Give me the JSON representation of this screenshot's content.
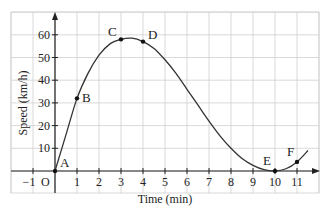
{
  "chart_data": {
    "type": "line",
    "title": "",
    "xlabel": "Time (min)",
    "ylabel": "Speed (km/h)",
    "xlim": [
      -1.5,
      12
    ],
    "ylim": [
      -5,
      65
    ],
    "grid": true,
    "x_ticks": [
      "-1",
      "1",
      "2",
      "3",
      "4",
      "5",
      "6",
      "7",
      "8",
      "9",
      "10",
      "11"
    ],
    "y_ticks": [
      "10",
      "20",
      "30",
      "40",
      "50",
      "60"
    ],
    "origin_label": "O",
    "points": [
      {
        "label": "A",
        "x": 0,
        "y": 0
      },
      {
        "label": "B",
        "x": 1,
        "y": 32
      },
      {
        "label": "C",
        "x": 3,
        "y": 58
      },
      {
        "label": "D",
        "x": 4,
        "y": 57
      },
      {
        "label": "E",
        "x": 10,
        "y": 0
      },
      {
        "label": "F",
        "x": 11,
        "y": 4
      }
    ],
    "curve": {
      "x": [
        0,
        0.5,
        1,
        1.5,
        2,
        2.5,
        3,
        3.5,
        4,
        4.5,
        5,
        5.5,
        6,
        6.5,
        7,
        7.5,
        8,
        8.5,
        9,
        9.5,
        10,
        10.5,
        11,
        11.5
      ],
      "y": [
        0,
        16,
        32,
        43,
        51,
        56,
        58,
        58.5,
        57,
        54,
        49,
        43,
        36,
        29,
        22,
        15.5,
        10,
        5.5,
        2.5,
        0.6,
        0,
        1,
        4,
        9
      ]
    },
    "legend": null
  },
  "colors": {
    "grid": "#cfcfcf",
    "axis": "#222222",
    "curve": "#333333",
    "point": "#111111"
  }
}
